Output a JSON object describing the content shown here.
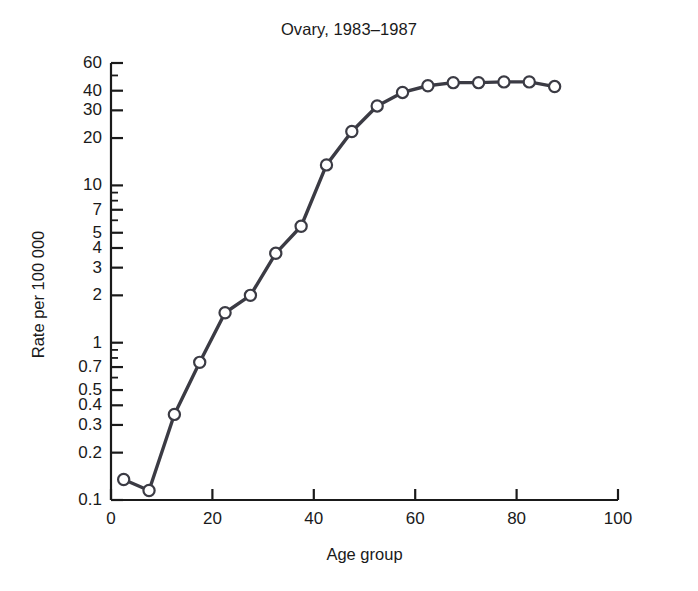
{
  "chart_data": {
    "type": "line",
    "title": "Ovary, 1983–1987",
    "xlabel": "Age group",
    "ylabel": "Rate per 100 000",
    "yscale": "log",
    "xlim": [
      0,
      100
    ],
    "ylim": [
      0.1,
      60
    ],
    "grid": false,
    "legend": null,
    "marker": "open-circle",
    "x": [
      2.5,
      7.5,
      12.5,
      17.5,
      22.5,
      27.5,
      32.5,
      37.5,
      42.5,
      47.5,
      52.5,
      57.5,
      62.5,
      67.5,
      72.5,
      77.5,
      82.5,
      87.5
    ],
    "values": [
      0.135,
      0.115,
      0.35,
      0.75,
      1.55,
      2.0,
      3.7,
      5.5,
      13.5,
      22.0,
      32.0,
      39.0,
      43.0,
      45.0,
      45.0,
      45.5,
      45.5,
      42.5
    ],
    "categories": [
      "2.5",
      "7.5",
      "12.5",
      "17.5",
      "22.5",
      "27.5",
      "32.5",
      "37.5",
      "42.5",
      "47.5",
      "52.5",
      "57.5",
      "62.5",
      "67.5",
      "72.5",
      "77.5",
      "82.5",
      "87.5"
    ],
    "yticks": [
      {
        "value": 60,
        "label": "60"
      },
      {
        "value": 40,
        "label": "40"
      },
      {
        "value": 30,
        "label": "30"
      },
      {
        "value": 20,
        "label": "20"
      },
      {
        "value": 10,
        "label": "10"
      },
      {
        "value": 7,
        "label": "7"
      },
      {
        "value": 5,
        "label": "5"
      },
      {
        "value": 4,
        "label": "4"
      },
      {
        "value": 3,
        "label": "3"
      },
      {
        "value": 2,
        "label": "2"
      },
      {
        "value": 1,
        "label": "1"
      },
      {
        "value": 0.7,
        "label": "0.7"
      },
      {
        "value": 0.5,
        "label": "0.5"
      },
      {
        "value": 0.4,
        "label": "0.4"
      },
      {
        "value": 0.3,
        "label": "0.3"
      },
      {
        "value": 0.2,
        "label": "0.2"
      },
      {
        "value": 0.1,
        "label": "0.1"
      }
    ],
    "yminorticks": [
      50,
      9,
      8,
      6,
      0.9,
      0.8,
      0.6
    ],
    "xticks": [
      {
        "value": 0,
        "label": "0"
      },
      {
        "value": 20,
        "label": "20"
      },
      {
        "value": 40,
        "label": "40"
      },
      {
        "value": 60,
        "label": "60"
      },
      {
        "value": 80,
        "label": "80"
      },
      {
        "value": 100,
        "label": "100"
      }
    ],
    "colors": {
      "line": "#3b3b44",
      "marker_stroke": "#3b3b44",
      "marker_fill": "#ffffff",
      "axis": "#1a1a1a",
      "text": "#1a1a1a",
      "background": "#ffffff"
    }
  }
}
